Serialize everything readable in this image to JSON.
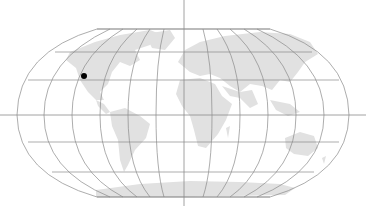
{
  "map": {
    "projection": "Robinson-like world map",
    "colors": {
      "background": "#ffffff",
      "land": "#e1e1e1",
      "graticule": "#8a8a8a",
      "marker": "#000000"
    },
    "graticule": {
      "parallels_y": [
        29,
        52,
        80,
        115,
        142,
        172,
        197
      ],
      "meridian_count": 13,
      "center_x": 184,
      "equator_y": 115
    },
    "markers": [
      {
        "label": "",
        "x": 84,
        "y": 76,
        "region": "western North America"
      }
    ]
  }
}
